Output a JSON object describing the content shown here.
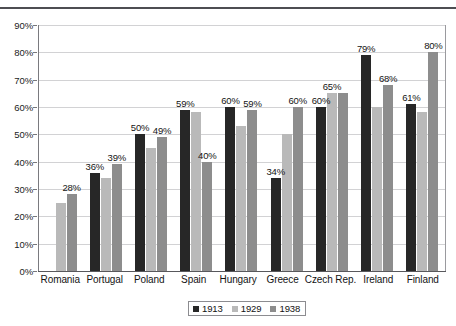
{
  "chart_data": {
    "type": "bar",
    "title": "",
    "xlabel": "",
    "ylabel": "",
    "ylim": [
      0,
      90
    ],
    "ytick_labels": [
      "0%",
      "10%",
      "20%",
      "30%",
      "40%",
      "50%",
      "60%",
      "70%",
      "80%",
      "90%"
    ],
    "ytick_values": [
      0,
      10,
      20,
      30,
      40,
      50,
      60,
      70,
      80,
      90
    ],
    "grid": true,
    "legend_position": "bottom-center",
    "categories": [
      "Romania",
      "Portugal",
      "Poland",
      "Spain",
      "Hungary",
      "Greece",
      "Czech Rep.",
      "Ireland",
      "Finland"
    ],
    "series": [
      {
        "name": "1913",
        "color": "#272727",
        "values": [
          null,
          36,
          50,
          59,
          60,
          34,
          60,
          79,
          61
        ],
        "labels": [
          "",
          "36%",
          "50%",
          "59%",
          "60%",
          "34%",
          "60%",
          "79%",
          "61%"
        ]
      },
      {
        "name": "1929",
        "color": "#b9b9b9",
        "values": [
          25,
          34,
          45,
          58,
          53,
          50,
          65,
          60,
          58
        ],
        "labels": [
          "",
          "",
          "",
          "",
          "",
          "",
          "65%",
          "",
          ""
        ]
      },
      {
        "name": "1938",
        "color": "#8d8d8d",
        "values": [
          28,
          39,
          49,
          40,
          59,
          60,
          65,
          68,
          80
        ],
        "labels": [
          "28%",
          "39%",
          "49%",
          "40%",
          "59%",
          "60%",
          "",
          "68%",
          "80%"
        ]
      }
    ]
  },
  "legend": {
    "items": [
      {
        "label": "1913",
        "series": "1913"
      },
      {
        "label": "1929",
        "series": "1929"
      },
      {
        "label": "1938",
        "series": "1938"
      }
    ]
  }
}
